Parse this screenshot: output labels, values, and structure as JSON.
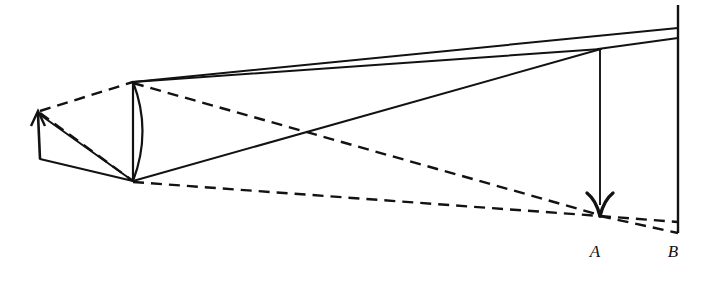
{
  "figure": {
    "background_color": "#ffffff",
    "stroke_color": "#121212",
    "width": 708,
    "height": 281
  },
  "labels": {
    "point_a": "A",
    "point_b": "B"
  },
  "label_positions": {
    "point_a": {
      "x": 595,
      "y": 257
    },
    "point_b": {
      "x": 673,
      "y": 257
    }
  },
  "geometry": {
    "object_arrow": {
      "name": "object-arrow",
      "base": {
        "x": 40,
        "y": 159
      },
      "tip": {
        "x": 38,
        "y": 112
      },
      "head_half_width": 7,
      "head_length": 13
    },
    "lens": {
      "name": "converging-lens",
      "top": {
        "x": 133,
        "y": 82
      },
      "bottom": {
        "x": 133,
        "y": 181
      },
      "arc_bulge_x": 150
    },
    "image_arrow": {
      "name": "image-arrow",
      "top": {
        "x": 600,
        "y": 50
      },
      "tip": {
        "x": 600,
        "y": 216
      },
      "head_half_width": 9,
      "head_length": 16
    },
    "screen_line": {
      "name": "screen-line",
      "top": {
        "x": 678,
        "y": 5
      },
      "bottom": {
        "x": 678,
        "y": 233
      }
    },
    "solid_rays": [
      {
        "name": "ray-object-tip-to-lens-bottom",
        "from": {
          "x": 39,
          "y": 114
        },
        "to": {
          "x": 133,
          "y": 181
        }
      },
      {
        "name": "ray-object-base-to-lens-bottom",
        "from": {
          "x": 40,
          "y": 159
        },
        "to": {
          "x": 133,
          "y": 181
        }
      },
      {
        "name": "ray-lens-top-to-image-point",
        "from": {
          "x": 133,
          "y": 82
        },
        "to": {
          "x": 600,
          "y": 49
        }
      },
      {
        "name": "ray-lens-top-to-screen-top",
        "from": {
          "x": 133,
          "y": 82
        },
        "to": {
          "x": 678,
          "y": 28
        }
      },
      {
        "name": "ray-lens-bottom-to-image-point",
        "from": {
          "x": 133,
          "y": 181
        },
        "to": {
          "x": 600,
          "y": 49
        }
      },
      {
        "name": "ray-image-point-to-screen",
        "from": {
          "x": 600,
          "y": 49
        },
        "to": {
          "x": 678,
          "y": 38
        }
      }
    ],
    "dashed_rays": [
      {
        "name": "dashed-ray-object-tip-to-lens-top",
        "from": {
          "x": 40,
          "y": 111
        },
        "to": {
          "x": 133,
          "y": 82
        }
      },
      {
        "name": "dashed-ray-object-tip-to-lens-bottom",
        "from": {
          "x": 40,
          "y": 113
        },
        "to": {
          "x": 133,
          "y": 181
        }
      },
      {
        "name": "dashed-ray-lens-top-to-image-a",
        "from": {
          "x": 133,
          "y": 83
        },
        "to": {
          "x": 600,
          "y": 215
        }
      },
      {
        "name": "dashed-ray-lens-bottom-to-image-a",
        "from": {
          "x": 133,
          "y": 182
        },
        "to": {
          "x": 600,
          "y": 216
        }
      },
      {
        "name": "dashed-ray-image-a-to-screen-upper",
        "from": {
          "x": 600,
          "y": 216
        },
        "to": {
          "x": 678,
          "y": 222
        }
      },
      {
        "name": "dashed-ray-image-a-to-screen-lower",
        "from": {
          "x": 600,
          "y": 216
        },
        "to": {
          "x": 678,
          "y": 233
        }
      }
    ]
  },
  "style": {
    "solid_stroke_width": 2.0,
    "dashed_stroke_width": 2.4,
    "dash_pattern": "11 7",
    "lens_stroke_width": 2.2,
    "screen_stroke_width": 2.4
  }
}
